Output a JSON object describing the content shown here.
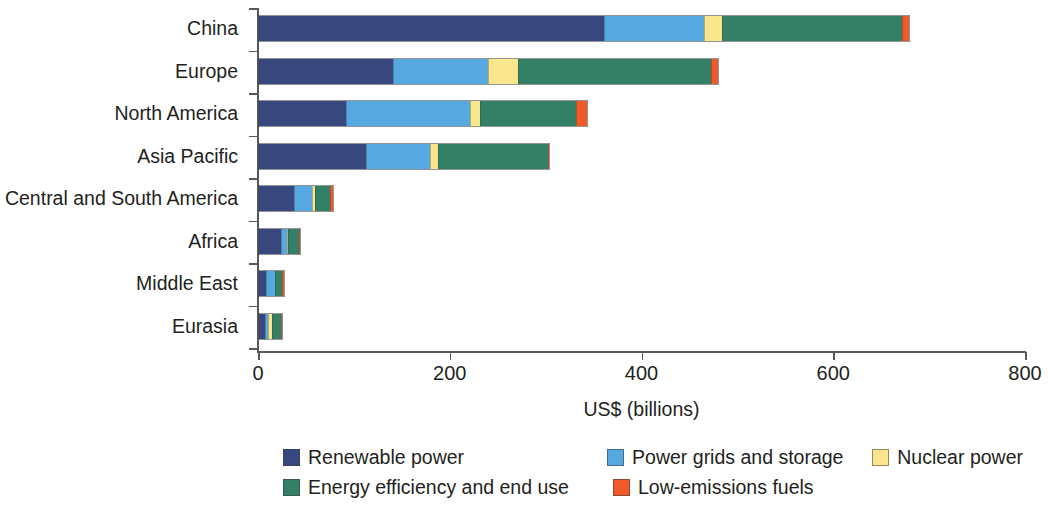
{
  "chart_data": {
    "type": "bar",
    "orientation": "horizontal",
    "stacked": true,
    "title": "",
    "xlabel": "US$ (billions)",
    "ylabel": "",
    "xlim": [
      0,
      800
    ],
    "xticks": [
      0,
      200,
      400,
      600,
      800
    ],
    "xtick_labels": [
      "0",
      "200",
      "400",
      "600",
      "800"
    ],
    "grid": false,
    "legend_position": "bottom",
    "categories": [
      "China",
      "Europe",
      "North America",
      "Asia Pacific",
      "Central and South America",
      "Africa",
      "Middle East",
      "Eurasia"
    ],
    "series": [
      {
        "name": "Renewable power",
        "color": "#39477f",
        "values": [
          361,
          140,
          91,
          112,
          38,
          24,
          8,
          7
        ]
      },
      {
        "name": "Power grids and storage",
        "color": "#56a9e0",
        "values": [
          105,
          100,
          130,
          68,
          19,
          7,
          10,
          3
        ]
      },
      {
        "name": "Nuclear power",
        "color": "#f8e58c",
        "values": [
          18,
          31,
          11,
          8,
          3,
          1,
          0,
          5
        ]
      },
      {
        "name": "Energy efficiency and end use",
        "color": "#348066",
        "values": [
          189,
          203,
          101,
          115,
          16,
          12,
          8,
          10
        ]
      },
      {
        "name": "Low-emissions fuels",
        "color": "#f05a28",
        "values": [
          7,
          7,
          11,
          2,
          3,
          1,
          2,
          1
        ]
      }
    ],
    "totals": [
      680,
      481,
      344,
      305,
      79,
      45,
      28,
      26
    ]
  },
  "legend": {
    "items": [
      {
        "label": "Renewable power",
        "color": "#39477f"
      },
      {
        "label": "Power grids and storage",
        "color": "#56a9e0"
      },
      {
        "label": "Nuclear power",
        "color": "#f8e58c"
      },
      {
        "label": "Energy efficiency and end use",
        "color": "#348066"
      },
      {
        "label": "Low-emissions fuels",
        "color": "#f05a28"
      }
    ]
  }
}
